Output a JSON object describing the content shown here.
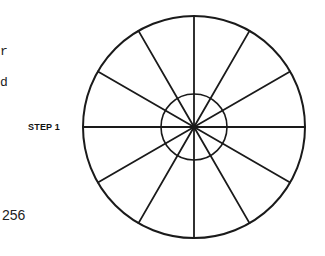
{
  "left_margin_text": {
    "fragment_1": "r",
    "fragment_2": "d"
  },
  "diagram": {
    "label": "STEP 1",
    "outer_circle": {
      "cx": 194,
      "cy": 127,
      "r": 111
    },
    "inner_circle": {
      "cx": 194,
      "cy": 127,
      "r": 33
    },
    "spoke_count": 12,
    "spoke_angle_step_deg": 30,
    "stroke_color": "#1a1a1a"
  },
  "page_number": "256"
}
